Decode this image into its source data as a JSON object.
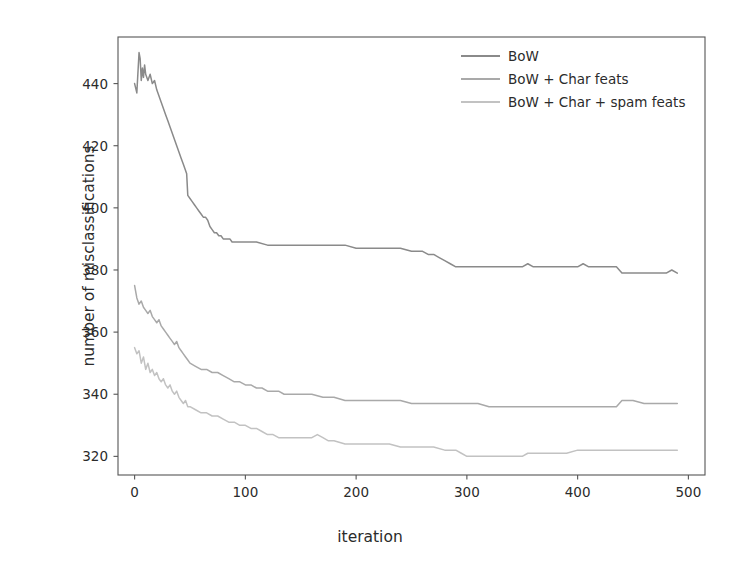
{
  "chart_data": {
    "type": "line",
    "title": "",
    "xlabel": "iteration",
    "ylabel": "number of misclassifications",
    "xlim": [
      -15,
      515
    ],
    "ylim": [
      314,
      455
    ],
    "xticks": [
      0,
      100,
      200,
      300,
      400,
      500
    ],
    "yticks": [
      320,
      340,
      360,
      380,
      400,
      420,
      440
    ],
    "xtick_labels": [
      "0",
      "100",
      "200",
      "300",
      "400",
      "500"
    ],
    "ytick_labels": [
      "320",
      "340",
      "360",
      "380",
      "400",
      "420",
      "440"
    ],
    "grid": false,
    "legend_position": "upper right",
    "colors": {
      "bow": "#8a8a8a",
      "bow_char": "#a9a9a9",
      "bow_char_spam": "#c2c2c2",
      "axis": "#555555",
      "text": "#2b2b2b",
      "background": "#ffffff"
    },
    "series": [
      {
        "name": "BoW",
        "color": "#8a8a8a",
        "x": [
          0,
          2,
          4,
          5,
          6,
          7,
          8,
          9,
          10,
          12,
          14,
          16,
          18,
          20,
          22,
          24,
          26,
          28,
          30,
          32,
          34,
          36,
          38,
          40,
          42,
          44,
          46,
          47,
          48,
          50,
          52,
          54,
          56,
          58,
          60,
          62,
          64,
          66,
          68,
          70,
          72,
          74,
          76,
          78,
          80,
          82,
          84,
          86,
          88,
          90,
          95,
          100,
          110,
          120,
          130,
          140,
          150,
          160,
          170,
          180,
          190,
          200,
          210,
          220,
          230,
          240,
          250,
          260,
          265,
          270,
          275,
          280,
          285,
          290,
          300,
          310,
          320,
          330,
          340,
          350,
          355,
          360,
          365,
          370,
          380,
          390,
          400,
          405,
          410,
          420,
          430,
          435,
          440,
          445,
          450,
          460,
          470,
          480,
          485,
          490
        ],
        "y": [
          440,
          437,
          450,
          448,
          441,
          445,
          442,
          446,
          443,
          441,
          443,
          440,
          441,
          438,
          436,
          434,
          432,
          430,
          428,
          426,
          424,
          422,
          420,
          418,
          416,
          414,
          412,
          411,
          404,
          403,
          402,
          401,
          400,
          399,
          398,
          397,
          397,
          396,
          394,
          393,
          392,
          392,
          391,
          391,
          390,
          390,
          390,
          390,
          389,
          389,
          389,
          389,
          389,
          388,
          388,
          388,
          388,
          388,
          388,
          388,
          388,
          387,
          387,
          387,
          387,
          387,
          386,
          386,
          385,
          385,
          384,
          383,
          382,
          381,
          381,
          381,
          381,
          381,
          381,
          381,
          382,
          381,
          381,
          381,
          381,
          381,
          381,
          382,
          381,
          381,
          381,
          381,
          379,
          379,
          379,
          379,
          379,
          379,
          380,
          379
        ]
      },
      {
        "name": "BoW + Char feats",
        "color": "#a9a9a9",
        "x": [
          0,
          2,
          4,
          6,
          8,
          10,
          12,
          14,
          16,
          18,
          20,
          22,
          24,
          26,
          28,
          30,
          32,
          34,
          36,
          38,
          40,
          42,
          44,
          46,
          48,
          50,
          55,
          60,
          65,
          70,
          75,
          80,
          85,
          90,
          95,
          100,
          105,
          110,
          115,
          120,
          125,
          130,
          135,
          140,
          150,
          160,
          170,
          180,
          190,
          200,
          210,
          220,
          230,
          240,
          250,
          260,
          270,
          280,
          290,
          300,
          310,
          320,
          330,
          340,
          350,
          360,
          370,
          380,
          390,
          400,
          410,
          420,
          430,
          435,
          440,
          445,
          450,
          460,
          470,
          480,
          490
        ],
        "y": [
          375,
          371,
          369,
          370,
          368,
          367,
          366,
          367,
          365,
          364,
          363,
          364,
          362,
          361,
          360,
          359,
          358,
          357,
          356,
          357,
          355,
          354,
          353,
          352,
          351,
          350,
          349,
          348,
          348,
          347,
          347,
          346,
          345,
          344,
          344,
          343,
          343,
          342,
          342,
          341,
          341,
          341,
          340,
          340,
          340,
          340,
          339,
          339,
          338,
          338,
          338,
          338,
          338,
          338,
          337,
          337,
          337,
          337,
          337,
          337,
          337,
          336,
          336,
          336,
          336,
          336,
          336,
          336,
          336,
          336,
          336,
          336,
          336,
          336,
          338,
          338,
          338,
          337,
          337,
          337,
          337
        ]
      },
      {
        "name": "BoW + Char + spam feats",
        "color": "#c2c2c2",
        "x": [
          0,
          2,
          4,
          6,
          8,
          10,
          12,
          14,
          16,
          18,
          20,
          22,
          24,
          26,
          28,
          30,
          32,
          34,
          36,
          38,
          40,
          42,
          44,
          46,
          48,
          50,
          55,
          60,
          65,
          70,
          75,
          80,
          85,
          90,
          95,
          100,
          105,
          110,
          115,
          120,
          125,
          130,
          140,
          150,
          160,
          165,
          170,
          175,
          180,
          190,
          200,
          210,
          220,
          230,
          240,
          250,
          260,
          270,
          280,
          290,
          295,
          300,
          310,
          320,
          330,
          340,
          350,
          355,
          360,
          370,
          380,
          390,
          400,
          410,
          420,
          430,
          440,
          450,
          460,
          470,
          480,
          490
        ],
        "y": [
          355,
          353,
          354,
          350,
          352,
          348,
          350,
          347,
          348,
          346,
          347,
          345,
          344,
          345,
          343,
          342,
          343,
          341,
          340,
          341,
          339,
          338,
          337,
          338,
          336,
          336,
          335,
          334,
          334,
          333,
          333,
          332,
          331,
          331,
          330,
          330,
          329,
          329,
          328,
          327,
          327,
          326,
          326,
          326,
          326,
          327,
          326,
          325,
          325,
          324,
          324,
          324,
          324,
          324,
          323,
          323,
          323,
          323,
          322,
          322,
          321,
          320,
          320,
          320,
          320,
          320,
          320,
          321,
          321,
          321,
          321,
          321,
          322,
          322,
          322,
          322,
          322,
          322,
          322,
          322,
          322,
          322
        ]
      }
    ]
  },
  "legend": {
    "items": [
      {
        "label": "BoW"
      },
      {
        "label": "BoW + Char feats"
      },
      {
        "label": "BoW + Char + spam feats"
      }
    ]
  }
}
